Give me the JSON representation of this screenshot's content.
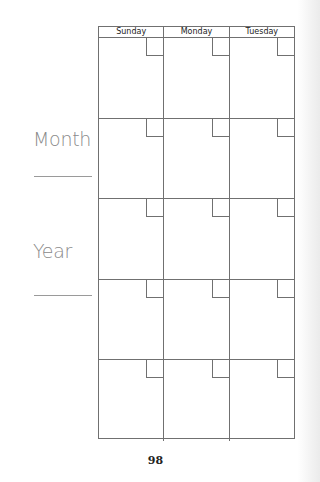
{
  "side_labels": {
    "month": "Month",
    "year": "Year"
  },
  "calendar": {
    "days": [
      "Sunday",
      "Monday",
      "Tuesday"
    ],
    "weeks": 5
  },
  "page_number": "98",
  "colors": {
    "grid_line": "#707070",
    "label_text": "#8a8a8a"
  }
}
